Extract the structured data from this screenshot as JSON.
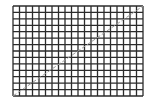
{
  "diagram": {
    "type": "grid-with-diagonal",
    "grid": {
      "columns": 20,
      "rows": 14,
      "x0": 13,
      "y0": 6,
      "x1": 143,
      "y1": 96,
      "line_color": "#2b2b2b",
      "line_width": 1.3
    },
    "diagonal": {
      "from": [
        13,
        96
      ],
      "to": [
        143,
        6
      ],
      "color": "#9a9a9a",
      "dash": "4,2",
      "width": 1
    },
    "background": "#ffffff"
  }
}
